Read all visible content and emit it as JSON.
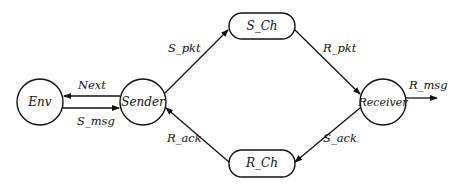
{
  "diagram": {
    "type": "state-transition / communication diagram",
    "nodes": [
      {
        "id": "env",
        "label": "Env",
        "shape": "circle"
      },
      {
        "id": "sender",
        "label": "Sender",
        "shape": "circle"
      },
      {
        "id": "s_ch",
        "label": "S_Ch",
        "shape": "rounded-rect"
      },
      {
        "id": "r_ch",
        "label": "R_Ch",
        "shape": "rounded-rect"
      },
      {
        "id": "receiver",
        "label": "Receiver",
        "shape": "circle"
      }
    ],
    "edges": [
      {
        "from": "sender",
        "to": "env",
        "label": "Next"
      },
      {
        "from": "env",
        "to": "sender",
        "label": "S_msg"
      },
      {
        "from": "sender",
        "to": "s_ch",
        "label": "S_pkt"
      },
      {
        "from": "s_ch",
        "to": "receiver",
        "label": "R_pkt"
      },
      {
        "from": "receiver",
        "to": "r_ch",
        "label": "S_ack"
      },
      {
        "from": "r_ch",
        "to": "sender",
        "label": "R_ack"
      },
      {
        "from": "receiver",
        "to": "out",
        "label": "R_msg"
      }
    ]
  }
}
